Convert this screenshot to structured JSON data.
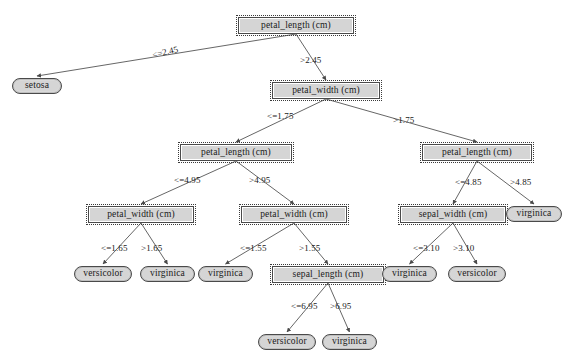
{
  "diagram": {
    "type": "decision-tree",
    "canvas": {
      "width": 570,
      "height": 364
    },
    "colors": {
      "node_fill": "#d5d5d5",
      "node_border": "#4a4a4a",
      "edge": "#555555",
      "text": "#1a1a1a",
      "background": "#ffffff"
    }
  },
  "nodes": [
    {
      "id": "n0",
      "label": "petal_length (cm)",
      "kind": "internal",
      "x": 238,
      "y": 17,
      "w": 116,
      "h": 17
    },
    {
      "id": "n1",
      "label": "setosa",
      "kind": "leaf",
      "x": 12,
      "y": 78,
      "w": 50,
      "h": 16
    },
    {
      "id": "n2",
      "label": "petal_width (cm)",
      "kind": "internal",
      "x": 272,
      "y": 82,
      "w": 108,
      "h": 17
    },
    {
      "id": "n3",
      "label": "petal_length (cm)",
      "kind": "internal",
      "x": 180,
      "y": 144,
      "w": 112,
      "h": 17
    },
    {
      "id": "n4",
      "label": "petal_length (cm)",
      "kind": "internal",
      "x": 422,
      "y": 144,
      "w": 110,
      "h": 17
    },
    {
      "id": "n5",
      "label": "petal_width (cm)",
      "kind": "internal",
      "x": 88,
      "y": 206,
      "w": 106,
      "h": 17
    },
    {
      "id": "n6",
      "label": "petal_width (cm)",
      "kind": "internal",
      "x": 241,
      "y": 206,
      "w": 106,
      "h": 17
    },
    {
      "id": "n7",
      "label": "sepal_width (cm)",
      "kind": "internal",
      "x": 400,
      "y": 206,
      "w": 106,
      "h": 17
    },
    {
      "id": "n8",
      "label": "virginica",
      "kind": "leaf",
      "x": 506,
      "y": 206,
      "w": 56,
      "h": 16
    },
    {
      "id": "n9",
      "label": "versicolor",
      "kind": "leaf",
      "x": 74,
      "y": 266,
      "w": 58,
      "h": 16
    },
    {
      "id": "n10",
      "label": "virginica",
      "kind": "leaf",
      "x": 140,
      "y": 266,
      "w": 55,
      "h": 16
    },
    {
      "id": "n11",
      "label": "virginica",
      "kind": "leaf",
      "x": 198,
      "y": 266,
      "w": 55,
      "h": 16
    },
    {
      "id": "n12",
      "label": "sepal_length (cm)",
      "kind": "internal",
      "x": 272,
      "y": 266,
      "w": 112,
      "h": 17
    },
    {
      "id": "n13",
      "label": "virginica",
      "kind": "leaf",
      "x": 382,
      "y": 266,
      "w": 55,
      "h": 16
    },
    {
      "id": "n14",
      "label": "versicolor",
      "kind": "leaf",
      "x": 448,
      "y": 266,
      "w": 58,
      "h": 16
    },
    {
      "id": "n15",
      "label": "versicolor",
      "kind": "leaf",
      "x": 258,
      "y": 334,
      "w": 58,
      "h": 16
    },
    {
      "id": "n16",
      "label": "virginica",
      "kind": "leaf",
      "x": 322,
      "y": 334,
      "w": 55,
      "h": 16
    }
  ],
  "edges": [
    {
      "from": "n0",
      "to": "n1",
      "label": "<=2.45",
      "lx": 152,
      "ly": 48,
      "rot": -13
    },
    {
      "from": "n0",
      "to": "n2",
      "label": ">2.45",
      "lx": 300,
      "ly": 56,
      "rot": 0
    },
    {
      "from": "n2",
      "to": "n3",
      "label": "<=1.75",
      "lx": 267,
      "ly": 112,
      "rot": 0
    },
    {
      "from": "n2",
      "to": ",n4",
      "label": ">1.75",
      "lx": 393,
      "ly": 116,
      "rot": 0
    },
    {
      "from": "n3",
      "to": "n5",
      "label": "<=4.95",
      "lx": 174,
      "ly": 176,
      "rot": 0
    },
    {
      "from": "n3",
      "to": "n6",
      "label": ">4.95",
      "lx": 249,
      "ly": 176,
      "rot": 0
    },
    {
      "from": "n4",
      "to": "n7",
      "label": "<=4.85",
      "lx": 455,
      "ly": 178,
      "rot": 0
    },
    {
      "from": "n4",
      "to": "n8",
      "label": ">4.85",
      "lx": 510,
      "ly": 178,
      "rot": 0
    },
    {
      "from": "n5",
      "to": "n9",
      "label": "<=1.65",
      "lx": 101,
      "ly": 244,
      "rot": 0
    },
    {
      "from": "n5",
      "to": "n10",
      "label": ">1.65",
      "lx": 141,
      "ly": 244,
      "rot": 0
    },
    {
      "from": "n6",
      "to": "n11",
      "label": "<=1.55",
      "lx": 240,
      "ly": 244,
      "rot": 0
    },
    {
      "from": "n6",
      "to": "n12",
      "label": ">1.55",
      "lx": 299,
      "ly": 244,
      "rot": 0
    },
    {
      "from": "n7",
      "to": "n13",
      "label": "<=3.10",
      "lx": 413,
      "ly": 244,
      "rot": 0
    },
    {
      "from": "n7",
      "to": "n14",
      "label": ">3.10",
      "lx": 453,
      "ly": 244,
      "rot": 0
    },
    {
      "from": "n12",
      "to": "n15",
      "label": "<=6.95",
      "lx": 291,
      "ly": 302,
      "rot": 0
    },
    {
      "from": "n12",
      "to": "n16",
      "label": ">6.95",
      "lx": 330,
      "ly": 302,
      "rot": 0
    }
  ]
}
